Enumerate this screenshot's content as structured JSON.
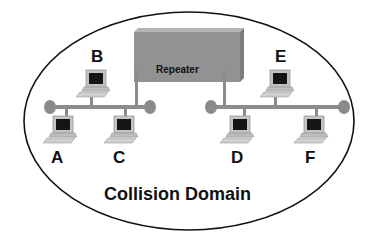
{
  "diagram": {
    "title": "Collision Domain",
    "repeater_label": "Repeater",
    "nodes": [
      {
        "id": "A",
        "label": "A"
      },
      {
        "id": "B",
        "label": "B"
      },
      {
        "id": "C",
        "label": "C"
      },
      {
        "id": "D",
        "label": "D"
      },
      {
        "id": "E",
        "label": "E"
      },
      {
        "id": "F",
        "label": "F"
      }
    ],
    "colors": {
      "bus": "#8c8c8c",
      "terminator": "#8a8a8a",
      "repeater_fill": "#8f8f8f",
      "repeater_top": "#b0b0b0",
      "ellipse_stroke": "#111111",
      "screen": "#151515",
      "computer_body": "#c8c8c8"
    }
  }
}
